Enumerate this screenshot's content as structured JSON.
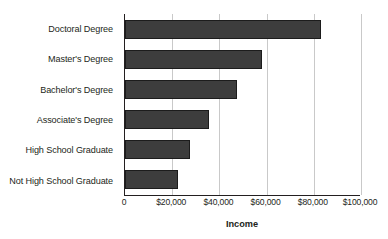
{
  "chart_data": {
    "type": "bar",
    "orientation": "horizontal",
    "title": "",
    "xlabel": "Income",
    "ylabel": "",
    "categories": [
      "Doctoral Degree",
      "Master's Degree",
      "Bachelor's Degree",
      "Associate's Degree",
      "High School Graduate",
      "Not High School Graduate"
    ],
    "values": [
      83000,
      58000,
      47500,
      35500,
      27500,
      22500
    ],
    "xlim": [
      0,
      100000
    ],
    "xticks": [
      0,
      20000,
      40000,
      60000,
      80000,
      100000
    ],
    "xticklabels": [
      "0",
      "$20,000",
      "$40,000",
      "$60,000",
      "$80,000",
      "$100,000"
    ],
    "grid": "vertical",
    "legend": null,
    "bar_color": "#3d3d3d",
    "bar_edge_color": "#1c1c1c",
    "gridline_color": "#c9c9c9",
    "axis_color": "#231f20",
    "background_color": "#ffffff"
  }
}
